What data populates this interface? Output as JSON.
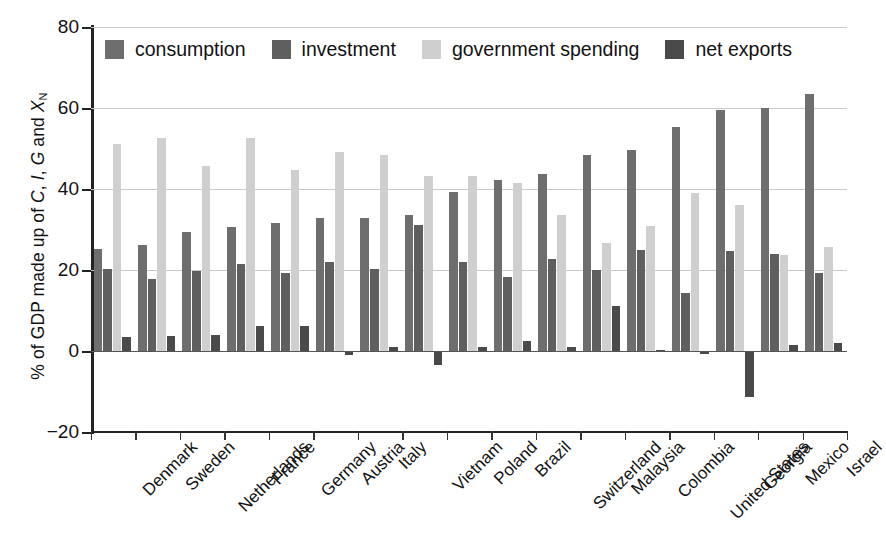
{
  "chart_data": {
    "type": "bar",
    "title": "",
    "xlabel": "",
    "ylabel": "% of GDP made up of C, I, G and X_N",
    "ylabel_parts": {
      "prefix": "% of GDP made up of ",
      "c": "C",
      "sep1": ", ",
      "i": "I",
      "sep2": ", ",
      "g": "G",
      "sep3": " and ",
      "x": "X",
      "xsub": "N"
    },
    "ylim": [
      -20,
      80
    ],
    "yticks": [
      -20,
      0,
      20,
      40,
      60,
      80
    ],
    "ytick_labels": [
      "−20",
      "0",
      "20",
      "40",
      "60",
      "80"
    ],
    "grid": "horizontal",
    "legend_position": "top-inside",
    "categories": [
      "Denmark",
      "Sweden",
      "Netherlands",
      "France",
      "Germany",
      "Austria",
      "Italy",
      "Vietnam",
      "Poland",
      "Brazil",
      "Switzerland",
      "Malaysia",
      "Colombia",
      "United States",
      "Georgia",
      "Mexico",
      "Israel"
    ],
    "series": [
      {
        "name": "consumption",
        "color": "#6e6e6e",
        "values": [
          25.3,
          26.2,
          29.3,
          30.6,
          31.6,
          32.8,
          32.9,
          33.6,
          39.2,
          42.3,
          43.8,
          48.5,
          49.6,
          55.2,
          59.6,
          59.9,
          63.4
        ]
      },
      {
        "name": "investment",
        "color": "#5f5f5f",
        "values": [
          20.3,
          17.9,
          19.8,
          21.5,
          19.3,
          21.9,
          20.2,
          31.0,
          21.9,
          18.2,
          22.6,
          20.0,
          24.9,
          14.3,
          24.6,
          23.9,
          19.2
        ]
      },
      {
        "name": "government spending",
        "color": "#cfcfcf",
        "values": [
          51.0,
          52.5,
          45.8,
          52.5,
          44.6,
          49.2,
          48.5,
          43.2,
          43.3,
          41.6,
          33.7,
          26.7,
          30.8,
          38.9,
          36.0,
          23.7,
          25.6
        ]
      },
      {
        "name": "net exports",
        "color": "#4a4a4a",
        "values": [
          3.5,
          3.6,
          4.0,
          6.2,
          6.3,
          -0.9,
          1.1,
          -3.4,
          0.9,
          2.4,
          1.0,
          11.2,
          0.3,
          -0.7,
          -11.4,
          1.6,
          2.0
        ]
      }
    ]
  },
  "legend": {
    "items": [
      {
        "label": "consumption",
        "swatch": "#6e6e6e"
      },
      {
        "label": "investment",
        "swatch": "#5f5f5f"
      },
      {
        "label": "government spending",
        "swatch": "#cfcfcf"
      },
      {
        "label": "net exports",
        "swatch": "#4a4a4a"
      }
    ]
  }
}
